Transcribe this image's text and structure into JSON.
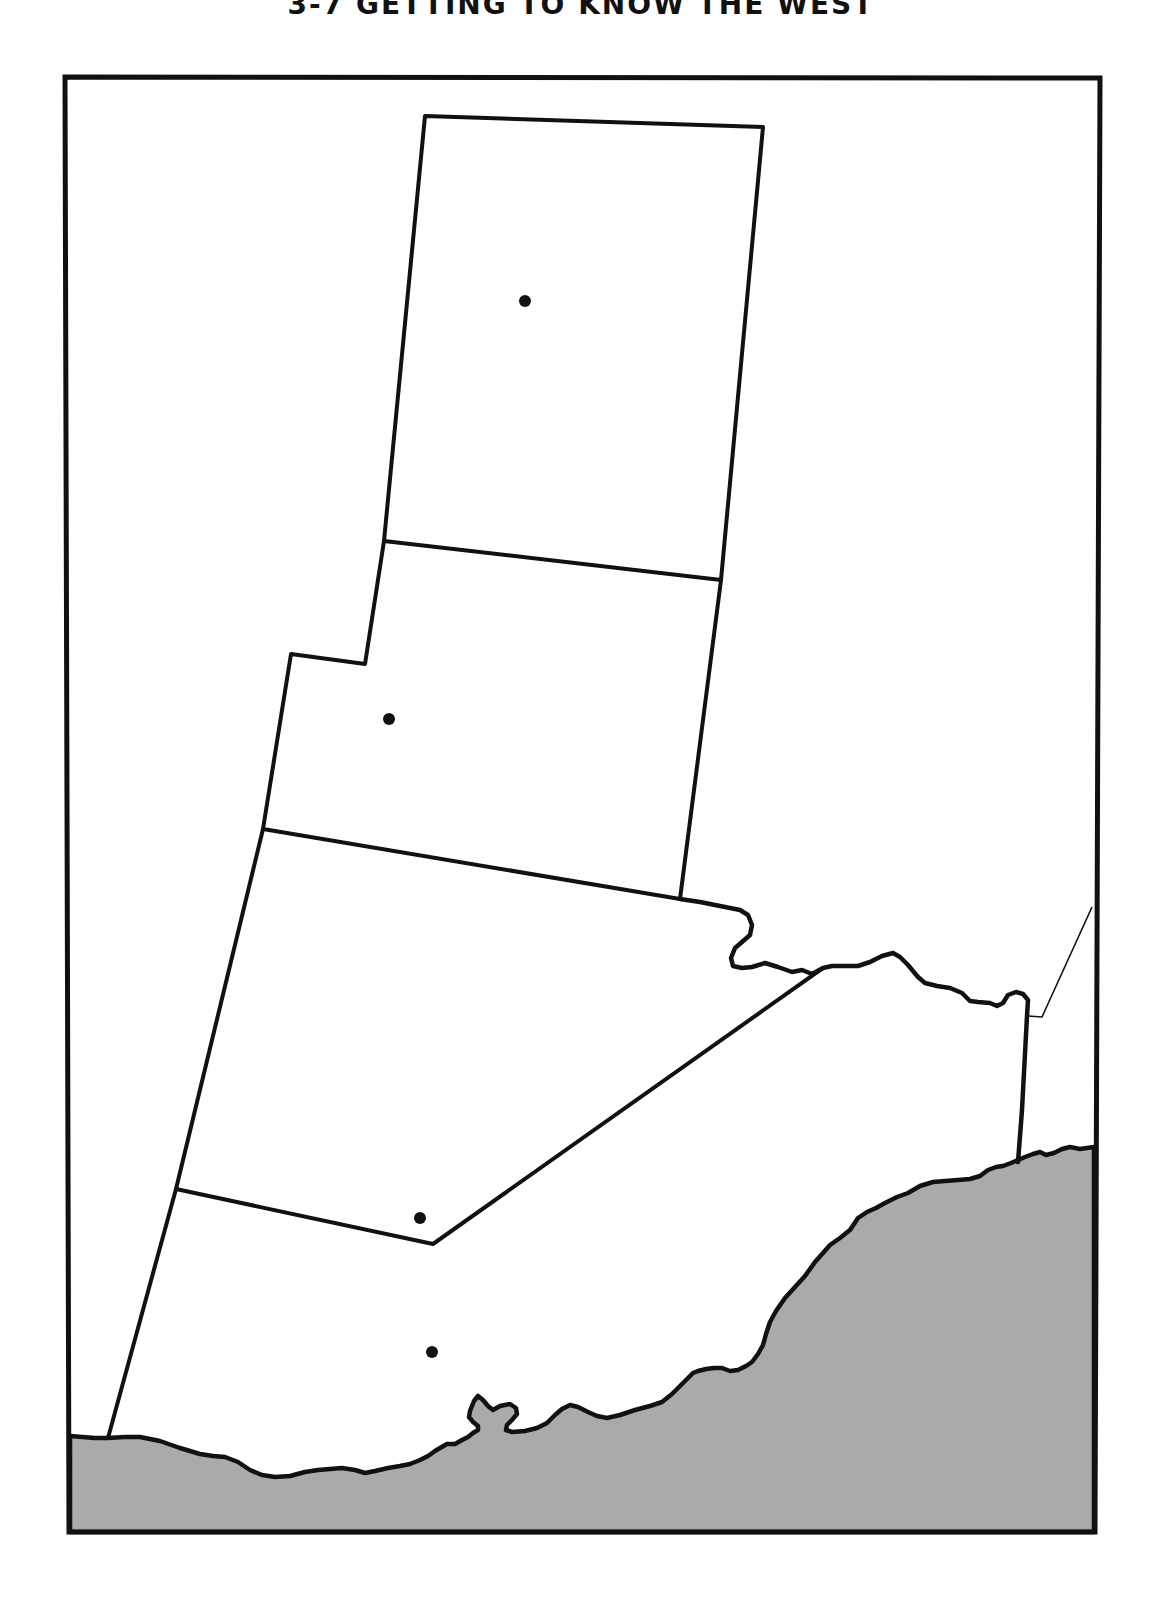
{
  "page": {
    "title": "3-7 GETTING TO KNOW THE WEST"
  },
  "map": {
    "type": "outline-map",
    "colors": {
      "land": "#ffffff",
      "water": "#aaaaaa",
      "border": "#111111"
    },
    "regions": [
      {
        "id": "region-1",
        "label": ""
      },
      {
        "id": "region-2",
        "label": ""
      },
      {
        "id": "region-3",
        "label": ""
      },
      {
        "id": "region-4",
        "label": ""
      },
      {
        "id": "region-5",
        "label": ""
      },
      {
        "id": "region-6",
        "label": ""
      }
    ],
    "capital_dots": [
      {
        "id": "dot-1",
        "x": 525,
        "y": 301
      },
      {
        "id": "dot-2",
        "x": 389,
        "y": 719
      },
      {
        "id": "dot-3",
        "x": 420,
        "y": 1218
      },
      {
        "id": "dot-4",
        "x": 432,
        "y": 1352
      }
    ],
    "features": {
      "river": "river-boundary",
      "coast": "shaded-water-body"
    }
  }
}
